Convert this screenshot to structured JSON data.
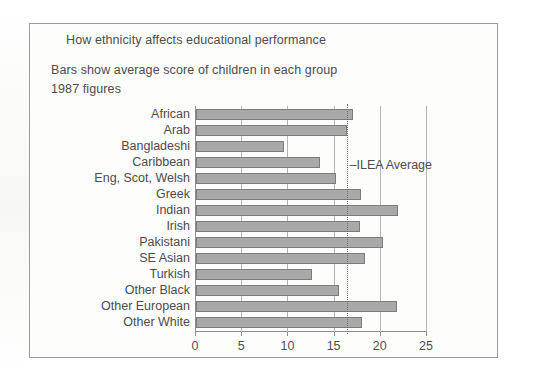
{
  "chart_data": {
    "type": "bar",
    "orientation": "horizontal",
    "title": "How ethnicity affects educational performance",
    "subtitle_1": "Bars show average score of children in each group",
    "subtitle_2": "1987 figures",
    "xlabel": "",
    "ylabel": "",
    "xlim": [
      0,
      25
    ],
    "grid": true,
    "legend": "none",
    "xticks": [
      0,
      5,
      10,
      15,
      20,
      25
    ],
    "xtick_labels": [
      "0",
      "5",
      "10",
      "15",
      "20",
      "25"
    ],
    "categories": [
      "African",
      "Arab",
      "Bangladeshi",
      "Caribbean",
      "Eng, Scot, Welsh",
      "Greek",
      "Indian",
      "Irish",
      "Pakistani",
      "SE Asian",
      "Turkish",
      "Other Black",
      "Other European",
      "Other White"
    ],
    "values": [
      17.0,
      16.3,
      9.5,
      13.4,
      15.1,
      17.9,
      21.9,
      17.8,
      20.2,
      18.3,
      12.6,
      15.5,
      21.7,
      18.0
    ],
    "annotations": [
      {
        "name": "ilea-average",
        "label": "–ILEA Average",
        "value": 16.4,
        "style": "dotted-vertical-line"
      }
    ],
    "colors": {
      "bar_fill": "#a9a9a9",
      "bar_stroke": "#7c7c7c",
      "gridline": "#b4b4b4",
      "axis": "#8d8d8d",
      "text": "#4c4c4c",
      "frame": "#9b9b9b",
      "background": "#fdfdfc"
    }
  }
}
